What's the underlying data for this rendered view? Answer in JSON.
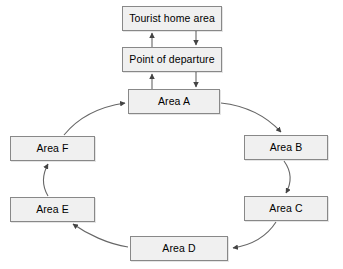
{
  "diagram": {
    "canvas": {
      "width": 343,
      "height": 269
    },
    "style": {
      "node_fill": "#f0f0f0",
      "node_border": "#888888",
      "edge_color": "#555555",
      "text_color": "#000000",
      "background": "#ffffff"
    },
    "nodes": [
      {
        "id": "home",
        "label": "Tourist home area",
        "x": 122,
        "y": 6,
        "w": 100,
        "h": 25
      },
      {
        "id": "departure",
        "label": "Point of departure",
        "x": 122,
        "y": 47,
        "w": 100,
        "h": 25
      },
      {
        "id": "areaA",
        "label": "Area A",
        "x": 128,
        "y": 89,
        "w": 92,
        "h": 25
      },
      {
        "id": "areaB",
        "label": "Area B",
        "x": 244,
        "y": 135,
        "w": 84,
        "h": 25
      },
      {
        "id": "areaC",
        "label": "Area C",
        "x": 244,
        "y": 196,
        "w": 84,
        "h": 25
      },
      {
        "id": "areaD",
        "label": "Area D",
        "x": 130,
        "y": 236,
        "w": 98,
        "h": 25
      },
      {
        "id": "areaE",
        "label": "Area E",
        "x": 10,
        "y": 197,
        "w": 85,
        "h": 25
      },
      {
        "id": "areaF",
        "label": "Area F",
        "x": 10,
        "y": 136,
        "w": 85,
        "h": 25
      }
    ],
    "edges": [
      {
        "id": "e1",
        "from": "departure",
        "to": "home",
        "kind": "straight-up",
        "label": ""
      },
      {
        "id": "e2",
        "from": "home",
        "to": "departure",
        "kind": "straight-down",
        "label": ""
      },
      {
        "id": "e3",
        "from": "areaA",
        "to": "departure",
        "kind": "straight-up",
        "label": ""
      },
      {
        "id": "e4",
        "from": "departure",
        "to": "areaA",
        "kind": "straight-down",
        "label": ""
      },
      {
        "id": "e5",
        "from": "areaA",
        "to": "areaB",
        "kind": "curve",
        "label": ""
      },
      {
        "id": "e6",
        "from": "areaB",
        "to": "areaC",
        "kind": "curve",
        "label": ""
      },
      {
        "id": "e7",
        "from": "areaC",
        "to": "areaD",
        "kind": "curve",
        "label": ""
      },
      {
        "id": "e8",
        "from": "areaD",
        "to": "areaE",
        "kind": "curve",
        "label": ""
      },
      {
        "id": "e9",
        "from": "areaE",
        "to": "areaF",
        "kind": "curve",
        "label": ""
      },
      {
        "id": "e10",
        "from": "areaF",
        "to": "areaA",
        "kind": "curve",
        "label": ""
      }
    ]
  }
}
